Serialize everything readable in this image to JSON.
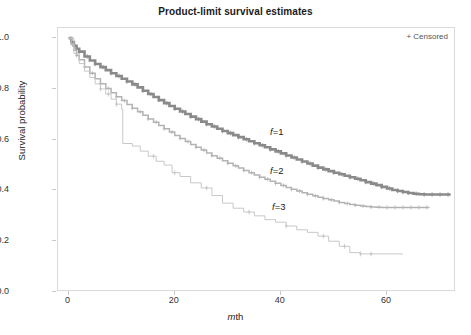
{
  "chart_title": "Product-limit survival estimates",
  "legend": {
    "censored": "+ Censored"
  },
  "axes": {
    "x": {
      "label_italic": "m",
      "label_rest": "th",
      "label_full": "mth",
      "ticks": [
        "0",
        "20",
        "40",
        "60"
      ],
      "tick_values": [
        0,
        20,
        40,
        60
      ],
      "min": -2,
      "max": 73
    },
    "y": {
      "label": "Survival probability",
      "ticks": [
        "0.0",
        "0.2",
        "0.4",
        "0.6",
        "0.8",
        "1.0"
      ],
      "tick_values": [
        0.0,
        0.2,
        0.4,
        0.6,
        0.8,
        1.0
      ],
      "min": 0.0,
      "max": 1.04
    }
  },
  "curve_labels": [
    {
      "name": "f-1",
      "italic": "f",
      "rest": "=1",
      "x_px": 270,
      "y_px": 126
    },
    {
      "name": "f-2",
      "italic": "f",
      "rest": "=2",
      "x_px": 270,
      "y_px": 165
    },
    {
      "name": "f-3",
      "italic": "f",
      "rest": "=3",
      "x_px": 272,
      "y_px": 201
    }
  ],
  "colors": {
    "curve_f1": "#8a8a8a",
    "curve_f2": "#b3b3b3",
    "curve_f3": "#c2c2c2",
    "frame": "#d9d9d9",
    "text": "#222222"
  },
  "chart_data": {
    "type": "line",
    "title": "Product-limit survival estimates",
    "subtitle": "",
    "xlabel": "mth",
    "ylabel": "Survival probability",
    "xlim": [
      -2,
      73
    ],
    "ylim": [
      0.0,
      1.04
    ],
    "grid": false,
    "legend_position": "inline-labels",
    "annotations": [
      "+ Censored",
      "f=1",
      "f=2",
      "f=3"
    ],
    "series": [
      {
        "name": "f=1",
        "color": "#8a8a8a",
        "style": "step-post",
        "x": [
          0,
          0.5,
          1,
          1.5,
          2,
          3,
          4,
          5,
          6,
          7,
          8,
          9,
          10,
          11,
          12,
          13,
          14,
          15,
          16,
          17,
          18,
          19,
          20,
          21,
          22,
          23,
          24,
          25,
          26,
          27,
          28,
          29,
          30,
          31,
          32,
          33,
          34,
          35,
          36,
          37,
          38,
          39,
          40,
          41,
          42,
          43,
          44,
          45,
          46,
          47,
          48,
          49,
          50,
          51,
          52,
          53,
          54,
          55,
          56,
          57,
          58,
          59,
          60,
          61,
          62,
          63,
          64,
          65,
          66,
          67,
          68,
          69,
          70,
          71,
          72
        ],
        "y": [
          1.0,
          0.985,
          0.97,
          0.958,
          0.947,
          0.928,
          0.912,
          0.898,
          0.886,
          0.874,
          0.862,
          0.851,
          0.84,
          0.829,
          0.818,
          0.806,
          0.793,
          0.78,
          0.768,
          0.756,
          0.744,
          0.733,
          0.722,
          0.711,
          0.701,
          0.691,
          0.681,
          0.671,
          0.661,
          0.652,
          0.643,
          0.634,
          0.626,
          0.618,
          0.61,
          0.602,
          0.594,
          0.586,
          0.578,
          0.57,
          0.562,
          0.554,
          0.546,
          0.538,
          0.53,
          0.522,
          0.514,
          0.506,
          0.498,
          0.49,
          0.483,
          0.476,
          0.47,
          0.464,
          0.458,
          0.452,
          0.446,
          0.44,
          0.433,
          0.427,
          0.421,
          0.414,
          0.408,
          0.402,
          0.398,
          0.394,
          0.39,
          0.387,
          0.385,
          0.384,
          0.384,
          0.384,
          0.384,
          0.384,
          0.384
        ],
        "censored_x": [
          1,
          2,
          3.5,
          5,
          6.5,
          8,
          9.5,
          11,
          12.5,
          14,
          15.5,
          17,
          18.5,
          20,
          21.5,
          23,
          24.5,
          26,
          27.5,
          29,
          30.5,
          32,
          33.5,
          35,
          36.5,
          38,
          39.5,
          41,
          42.5,
          44,
          45.5,
          47,
          48.5,
          50,
          51.5,
          53,
          54.5,
          56,
          57.5,
          59,
          60.5,
          62,
          63,
          64,
          65.5,
          67,
          68.5,
          70,
          71.5
        ]
      },
      {
        "name": "f=2",
        "color": "#b3b3b3",
        "style": "step-post",
        "x": [
          0,
          0.5,
          1,
          1.5,
          2,
          3,
          4,
          5,
          6,
          7,
          8,
          9,
          10,
          11,
          12,
          13,
          14,
          15,
          16,
          17,
          18,
          19,
          20,
          21,
          22,
          23,
          24,
          25,
          26,
          27,
          28,
          29,
          30,
          31,
          32,
          33,
          34,
          35,
          36,
          37,
          38,
          39,
          40,
          41,
          42,
          43,
          44,
          45,
          46,
          47,
          48,
          49,
          50,
          51,
          52,
          53,
          54,
          55,
          56,
          57,
          58,
          59,
          60,
          61,
          62,
          63,
          64,
          65,
          66,
          67,
          68
        ],
        "y": [
          1.0,
          0.975,
          0.952,
          0.932,
          0.915,
          0.886,
          0.862,
          0.84,
          0.82,
          0.802,
          0.785,
          0.769,
          0.754,
          0.739,
          0.724,
          0.71,
          0.696,
          0.682,
          0.669,
          0.656,
          0.643,
          0.63,
          0.617,
          0.605,
          0.593,
          0.581,
          0.57,
          0.559,
          0.548,
          0.537,
          0.527,
          0.517,
          0.507,
          0.497,
          0.488,
          0.479,
          0.47,
          0.461,
          0.452,
          0.444,
          0.436,
          0.428,
          0.42,
          0.412,
          0.405,
          0.398,
          0.391,
          0.385,
          0.379,
          0.373,
          0.368,
          0.363,
          0.358,
          0.353,
          0.349,
          0.345,
          0.342,
          0.339,
          0.337,
          0.335,
          0.334,
          0.333,
          0.333,
          0.333,
          0.333,
          0.333,
          0.333,
          0.333,
          0.333,
          0.333,
          0.333
        ],
        "censored_x": [
          1.5,
          3,
          4.5,
          6,
          7.5,
          9,
          10.5,
          12,
          13.5,
          15,
          16.5,
          18,
          19.5,
          21,
          22.5,
          24,
          25.5,
          27,
          28.5,
          30,
          31.5,
          33,
          34.5,
          36,
          37.5,
          39,
          40.5,
          42,
          43.5,
          45,
          46.5,
          48,
          49.5,
          51,
          52.5,
          54,
          55.5,
          57,
          58.5,
          60,
          61.5,
          63,
          64.5,
          66,
          67.5
        ]
      },
      {
        "name": "f=3",
        "color": "#c2c2c2",
        "style": "step-post",
        "x": [
          0,
          1,
          2,
          3,
          4,
          5,
          6,
          7,
          8,
          9,
          10,
          10.2,
          12,
          13.5,
          15,
          16.5,
          18,
          19.5,
          21,
          23,
          25,
          27,
          29,
          31,
          33,
          35,
          37,
          39,
          41,
          43,
          45,
          47,
          49,
          51,
          53,
          55,
          57,
          59,
          61,
          63
        ],
        "y": [
          1.0,
          0.94,
          0.9,
          0.87,
          0.845,
          0.82,
          0.8,
          0.78,
          0.76,
          0.74,
          0.72,
          0.585,
          0.575,
          0.555,
          0.535,
          0.515,
          0.5,
          0.47,
          0.455,
          0.43,
          0.41,
          0.38,
          0.35,
          0.33,
          0.315,
          0.3,
          0.285,
          0.275,
          0.26,
          0.245,
          0.235,
          0.22,
          0.2,
          0.18,
          0.155,
          0.15,
          0.15,
          0.15,
          0.15,
          0.15
        ],
        "censored_x": [
          6,
          7.5,
          9,
          16,
          20,
          26,
          34,
          41,
          48,
          52,
          55,
          57
        ]
      }
    ]
  }
}
